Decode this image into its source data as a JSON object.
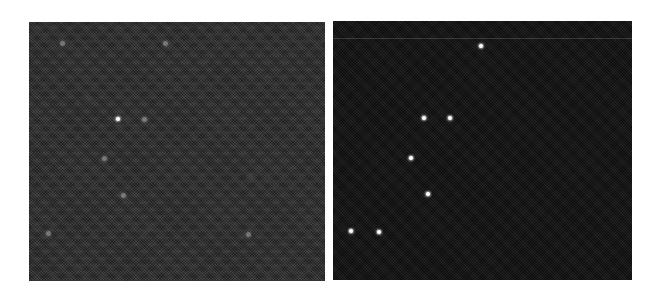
{
  "figure": {
    "panels": [
      {
        "id": "left",
        "description": "noisy star field (grey speckled background)",
        "background": "#2f2f2f",
        "bright_stars": [
          {
            "x": 118,
            "y": 119
          }
        ],
        "faint_stars": [
          {
            "x": 104,
            "y": 158
          },
          {
            "x": 144,
            "y": 119
          },
          {
            "x": 123,
            "y": 195
          },
          {
            "x": 248,
            "y": 234
          },
          {
            "x": 48,
            "y": 233
          },
          {
            "x": 62,
            "y": 43
          },
          {
            "x": 165,
            "y": 43
          }
        ]
      },
      {
        "id": "right",
        "description": "denoised / detected star field (dark background with bright points)",
        "background": "#161616",
        "bright_stars": [
          {
            "x": 481,
            "y": 46
          },
          {
            "x": 424,
            "y": 118
          },
          {
            "x": 450,
            "y": 118
          },
          {
            "x": 411,
            "y": 158
          },
          {
            "x": 428,
            "y": 194
          },
          {
            "x": 351,
            "y": 231
          },
          {
            "x": 379,
            "y": 232
          }
        ],
        "faint_stars": []
      }
    ]
  }
}
